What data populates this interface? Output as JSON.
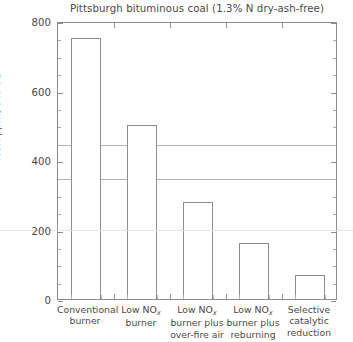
{
  "chart_data": {
    "type": "bar",
    "title": "Pittsburgh bituminous coal (1.3% N dry-ash-free)",
    "xlabel": "",
    "ylabel": "NOx ppm, 3% O2",
    "ylim": [
      0,
      800
    ],
    "ytick_labels": [
      "0",
      "200",
      "400",
      "600",
      "800"
    ],
    "ytick_values": [
      0,
      200,
      400,
      600,
      800
    ],
    "yminor_step": 50,
    "grid": false,
    "legend": "none",
    "categories": [
      "Conventional\nburner",
      "Low NOx\nburner",
      "Low NOx\nburner plus\nover-fire air",
      "Low NOx\nburner plus\nreburning",
      "Selective\ncatalytic\nreduction"
    ],
    "category_lines": [
      [
        "Conventional",
        "burner"
      ],
      [
        "Low NO",
        "burner"
      ],
      [
        "Low NO",
        "burner plus",
        "over-fire air"
      ],
      [
        "Low NO",
        "burner plus",
        "reburning"
      ],
      [
        "Selective",
        "catalytic",
        "reduction"
      ]
    ],
    "values": [
      750,
      500,
      280,
      160,
      70
    ],
    "reference_lines": [
      450,
      350
    ],
    "bar_edge_color": "#8d8d8d",
    "bar_face_color": "#ffffff",
    "axis_color": "#8d8d8d",
    "text_color": "#4a4a4a",
    "reference_line_color": "#b4b4b4"
  },
  "labels": {
    "y_axis_prefix": "NOx ppm, 3% O",
    "y_axis_suffix": "2",
    "nox_prefix": "Low NO",
    "nox_sub": "x"
  }
}
